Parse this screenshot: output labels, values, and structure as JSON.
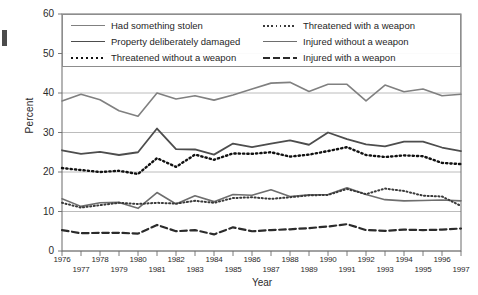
{
  "chart_data": {
    "type": "line",
    "title": "",
    "xlabel": "Year",
    "ylabel": "Percent",
    "ylim": [
      0,
      60
    ],
    "yticks": [
      0,
      10,
      20,
      30,
      40,
      50,
      60
    ],
    "grid": "horizontal",
    "legend_position": "top-inside-two-columns",
    "x": [
      1976,
      1977,
      1978,
      1979,
      1980,
      1981,
      1982,
      1983,
      1984,
      1985,
      1986,
      1987,
      1988,
      1989,
      1990,
      1991,
      1992,
      1993,
      1994,
      1995,
      1996,
      1997
    ],
    "categories": [
      "1976",
      "1977",
      "1978",
      "1979",
      "1980",
      "1981",
      "1982",
      "1983",
      "1984",
      "1985",
      "1986",
      "1987",
      "1988",
      "1989",
      "1990",
      "1991",
      "1992",
      "1993",
      "1994",
      "1995",
      "1996",
      "1997"
    ],
    "series": [
      {
        "name": "Had something stolen",
        "style": "solid",
        "color": "#808080",
        "width": 1.6,
        "values": [
          38.0,
          39.7,
          38.3,
          35.5,
          34.1,
          40.0,
          38.5,
          39.3,
          38.2,
          39.5,
          41.0,
          42.5,
          42.7,
          40.4,
          42.2,
          42.2,
          38.0,
          42.0,
          40.3,
          41.0,
          39.3,
          39.7
        ]
      },
      {
        "name": "Property deliberately damaged",
        "style": "solid",
        "color": "#4d4d4d",
        "width": 1.8,
        "values": [
          25.5,
          24.6,
          25.1,
          24.3,
          25.0,
          31.0,
          25.8,
          25.7,
          24.4,
          27.2,
          26.3,
          27.2,
          28.0,
          26.9,
          30.0,
          28.3,
          27.0,
          26.5,
          27.7,
          27.7,
          26.2,
          25.3
        ]
      },
      {
        "name": "Threatened without a weapon",
        "style": "dotted",
        "color": "#111111",
        "width": 2.4,
        "values": [
          21.0,
          20.5,
          20.0,
          20.3,
          19.5,
          23.5,
          21.3,
          24.4,
          23.1,
          24.7,
          24.6,
          25.0,
          23.9,
          24.4,
          25.3,
          26.3,
          24.3,
          23.8,
          24.2,
          24.0,
          22.3,
          22.0
        ]
      },
      {
        "name": "Injured without a weapon",
        "style": "solid",
        "color": "#6e6e6e",
        "width": 1.6,
        "values": [
          13.2,
          11.3,
          12.2,
          12.3,
          10.8,
          14.8,
          11.9,
          14.0,
          12.5,
          14.3,
          14.1,
          15.5,
          13.8,
          14.2,
          14.3,
          16.0,
          14.3,
          13.0,
          12.7,
          12.8,
          12.9,
          12.7
        ]
      },
      {
        "name": "Threatened with a weapon",
        "style": "dotted",
        "color": "#3a3a3a",
        "width": 2.0,
        "values": [
          12.2,
          11.0,
          11.6,
          12.2,
          11.9,
          12.2,
          12.0,
          12.7,
          12.2,
          13.4,
          13.6,
          13.2,
          13.6,
          14.1,
          14.2,
          15.7,
          14.4,
          15.8,
          15.2,
          14.0,
          13.8,
          11.4
        ]
      },
      {
        "name": "Injured with a weapon",
        "style": "dashed",
        "color": "#2b2b2b",
        "width": 2.2,
        "values": [
          5.3,
          4.5,
          4.6,
          4.6,
          4.4,
          6.6,
          5.0,
          5.3,
          4.2,
          6.0,
          5.0,
          5.3,
          5.5,
          5.8,
          6.2,
          6.8,
          5.3,
          5.1,
          5.4,
          5.3,
          5.4,
          5.7
        ]
      }
    ]
  },
  "legend": {
    "column_left": [
      {
        "label": "Had something stolen",
        "style": "solid",
        "color": "#808080",
        "width": 1.6
      },
      {
        "label": "Property deliberately damaged",
        "style": "solid",
        "color": "#4d4d4d",
        "width": 1.8
      },
      {
        "label": "Threatened without a weapon",
        "style": "dotted",
        "color": "#111111",
        "width": 2.4
      }
    ],
    "column_right": [
      {
        "label": "Threatened with a weapon",
        "style": "dotted",
        "color": "#3a3a3a",
        "width": 2.0
      },
      {
        "label": "Injured without a weapon",
        "style": "solid",
        "color": "#6e6e6e",
        "width": 1.6
      },
      {
        "label": "Injured with a weapon",
        "style": "dashed",
        "color": "#2b2b2b",
        "width": 2.2
      }
    ]
  },
  "axis": {
    "y_title": "Percent",
    "x_title": "Year",
    "y_tick_labels": [
      "60",
      "50",
      "40",
      "30",
      "20",
      "10",
      "0"
    ],
    "x_tick_labels_top": [
      "1976",
      "1978",
      "1980",
      "1982",
      "1984",
      "1986",
      "1988",
      "1990",
      "1992",
      "1994",
      "1996"
    ],
    "x_tick_labels_bottom": [
      "1977",
      "1979",
      "1981",
      "1983",
      "1985",
      "1987",
      "1989",
      "1991",
      "1993",
      "1995",
      "1997"
    ]
  },
  "colors": {
    "frame": "#6b6b6b",
    "grid": "#b4b4b4",
    "text": "#1f1f1f",
    "background": "#ffffff"
  }
}
